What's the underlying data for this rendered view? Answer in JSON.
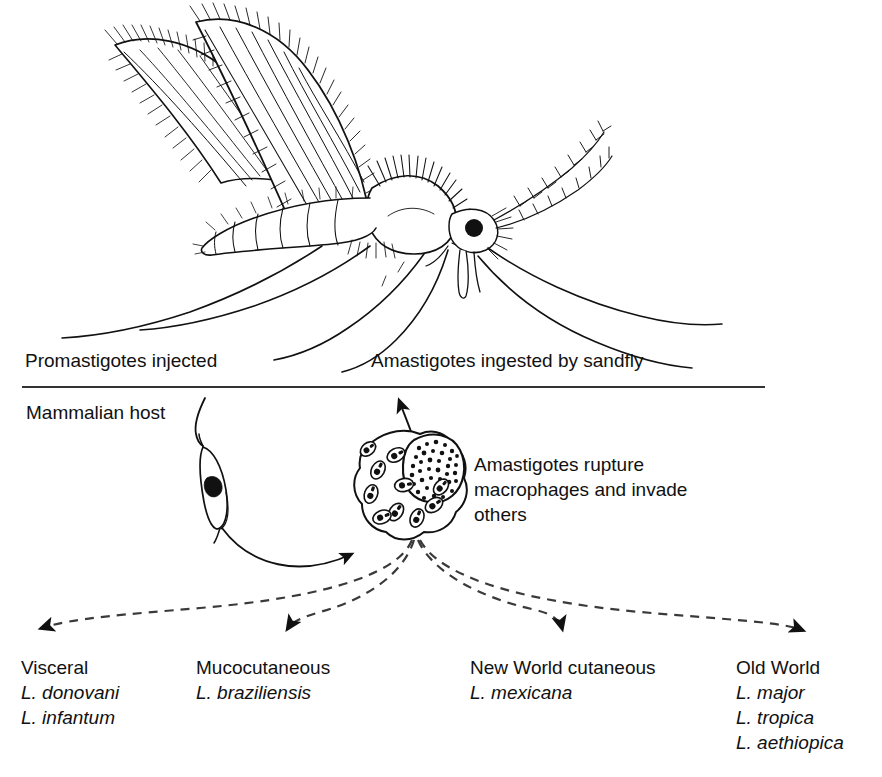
{
  "figure": {
    "background_color": "#ffffff",
    "ink_color": "#111111"
  },
  "labels": {
    "promastigotes_injected": "Promastigotes injected",
    "amastigotes_ingested": "Amastigotes ingested by sandfly",
    "mammalian_host": "Mammalian host",
    "rupture_line1": "Amastigotes rupture",
    "rupture_line2": "macrophages and invade",
    "rupture_line3": "others"
  },
  "organisms": {
    "sandfly": "sandfly-illustration",
    "promastigote": "promastigote-cell",
    "macrophage": "infected-macrophage",
    "amastigote_count": 10
  },
  "outcomes": [
    {
      "name": "visceral",
      "heading": "Visceral",
      "species": [
        "L. donovani",
        "L. infantum"
      ]
    },
    {
      "name": "mucocutaneous",
      "heading": "Mucocutaneous",
      "species": [
        "L. braziliensis"
      ]
    },
    {
      "name": "new-world-cutaneous",
      "heading": "New World cutaneous",
      "species": [
        "L. mexicana"
      ]
    },
    {
      "name": "old-world",
      "heading": "Old World",
      "species": [
        "L. major",
        "L. tropica",
        "L. aethiopica"
      ]
    }
  ]
}
